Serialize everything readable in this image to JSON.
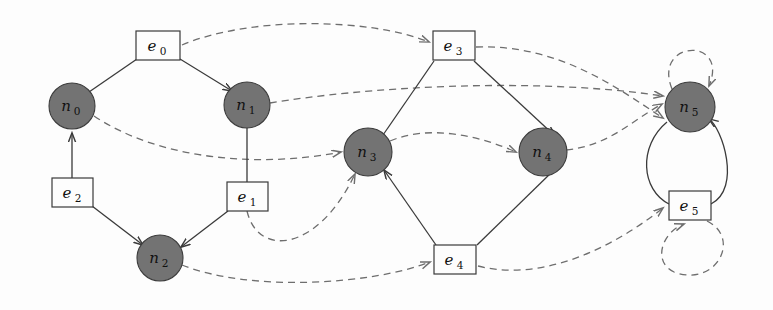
{
  "figure": {
    "background_color": "#fdfdfd",
    "node_fill_color": "#737373",
    "node_stroke_color": "#3d3d3d",
    "solid_edge_color": "#3a3a3a",
    "dashed_edge_color": "#6e6e6e",
    "box_fill_color": "#fdfdfd",
    "label_color": "#111111"
  },
  "nodes": [
    {
      "id": "n0",
      "base": "n",
      "sub": "0",
      "cx": 72,
      "cy": 106,
      "r": 23
    },
    {
      "id": "n1",
      "base": "n",
      "sub": "1",
      "cx": 247,
      "cy": 105,
      "r": 23
    },
    {
      "id": "n2",
      "base": "n",
      "sub": "2",
      "cx": 160,
      "cy": 258,
      "r": 23
    },
    {
      "id": "n3",
      "base": "n",
      "sub": "3",
      "cx": 368,
      "cy": 152,
      "r": 24
    },
    {
      "id": "n4",
      "base": "n",
      "sub": "4",
      "cx": 543,
      "cy": 152,
      "r": 24
    },
    {
      "id": "n5",
      "base": "n",
      "sub": "5",
      "cx": 690,
      "cy": 107,
      "r": 25
    }
  ],
  "edge_boxes": [
    {
      "id": "e0",
      "base": "e",
      "sub": "0",
      "x": 136,
      "y": 31,
      "w": 44,
      "h": 29
    },
    {
      "id": "e1",
      "base": "e",
      "sub": "1",
      "x": 227,
      "y": 182,
      "w": 41,
      "h": 29
    },
    {
      "id": "e2",
      "base": "e",
      "sub": "2",
      "x": 52,
      "y": 178,
      "w": 41,
      "h": 29
    },
    {
      "id": "e3",
      "base": "e",
      "sub": "3",
      "x": 433,
      "y": 31,
      "w": 42,
      "h": 29
    },
    {
      "id": "e4",
      "base": "e",
      "sub": "4",
      "x": 434,
      "y": 245,
      "w": 42,
      "h": 29
    },
    {
      "id": "e5",
      "base": "e",
      "sub": "5",
      "x": 669,
      "y": 191,
      "w": 42,
      "h": 29
    }
  ],
  "solid_edges": [
    {
      "from": "n0",
      "to": "e0",
      "arrow": false,
      "path": "M 89 92 L 137 58"
    },
    {
      "from": "e0",
      "to": "n1",
      "arrow": true,
      "path": "M 180 58 L 234 92"
    },
    {
      "from": "e2",
      "to": "n0",
      "arrow": true,
      "path": "M 72 178 L 72 132"
    },
    {
      "from": "e2",
      "to": "n2",
      "arrow": true,
      "path": "M 92 206 L 144 246"
    },
    {
      "from": "n1",
      "to": "e1",
      "arrow": false,
      "path": "M 247 128 L 247 182"
    },
    {
      "from": "e1",
      "to": "n2",
      "arrow": true,
      "path": "M 228 210 L 180 248"
    },
    {
      "from": "n3",
      "to": "e3",
      "arrow": false,
      "path": "M 384 136 L 433 60"
    },
    {
      "from": "e3",
      "to": "n4",
      "arrow": true,
      "path": "M 474 60 L 556 137"
    },
    {
      "from": "e4",
      "to": "n3",
      "arrow": true,
      "path": "M 435 246 L 384 169"
    },
    {
      "from": "n4",
      "to": "e4",
      "arrow": false,
      "path": "M 555 170 L 476 246"
    },
    {
      "from": "n5",
      "to": "e5",
      "arrow": false,
      "path": "M 668 121 C 640 145, 642 190, 669 205"
    },
    {
      "from": "e5",
      "to": "n5",
      "arrow": true,
      "path": "M 711 205 C 739 190, 717 126, 708 120"
    }
  ],
  "dashed_edges": [
    {
      "from": "e0",
      "to": "e3",
      "arrow": true,
      "note": "arc over top"
    },
    {
      "from": "n0",
      "to": "n3",
      "arrow": true,
      "note": "arc right"
    },
    {
      "from": "n1",
      "to": "n5",
      "arrow": true,
      "note": "long arc right"
    },
    {
      "from": "n3",
      "to": "n4",
      "arrow": true,
      "note": "arc right"
    },
    {
      "from": "n4",
      "to": "n5",
      "arrow": true,
      "note": "arc up right"
    },
    {
      "from": "n2",
      "to": "e4",
      "arrow": true,
      "note": "arc along bottom"
    },
    {
      "from": "e1",
      "to": "n3",
      "arrow": true,
      "note": "arc up right"
    },
    {
      "from": "e3",
      "to": "e5",
      "arrow": true,
      "note": "arc down right"
    },
    {
      "from": "e4",
      "to": "e5",
      "arrow": true,
      "note": "arc right bottom"
    },
    {
      "from": "n5",
      "to": "n5",
      "arrow": true,
      "note": "self loop above n5"
    },
    {
      "from": "e5",
      "to": "e5",
      "arrow": true,
      "note": "self loop below e5"
    }
  ]
}
